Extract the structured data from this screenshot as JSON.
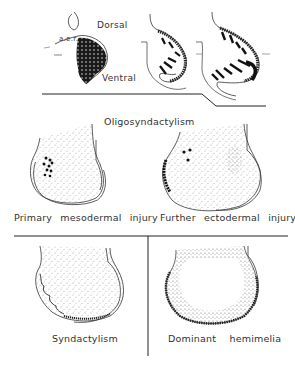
{
  "top_panel": {
    "labels": {
      "dorsal": "Dorsal",
      "ventral": "Ventral",
      "aer": "a.e.r."
    }
  },
  "section_title": "Oligosyndactylism",
  "panels": [
    {
      "id": "primary-mesodermal-injury",
      "caption": "Primary mesodermal injury"
    },
    {
      "id": "further-ectodermal-injury",
      "caption": "Further ectodermal injury"
    },
    {
      "id": "syndactylism",
      "caption": "Syndactylism"
    },
    {
      "id": "dominant-hemimelia",
      "caption": "Dominant hemimelia"
    }
  ],
  "colors": {
    "ink": "#222222",
    "stipple": "#555555",
    "background": "#ffffff"
  }
}
